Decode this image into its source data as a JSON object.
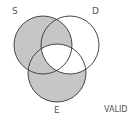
{
  "diagram": {
    "type": "venn",
    "sets": [
      "S",
      "D",
      "E"
    ],
    "shaded_regions": [
      "S only",
      "S∩D only",
      "S∩E only",
      "E only"
    ],
    "unshaded_regions": [
      "D only",
      "D∩E only",
      "S∩D∩E"
    ],
    "verdict": "VALID",
    "shade_color": "#c6c6c6",
    "stroke_color": "#333333"
  },
  "labels": {
    "s": "S",
    "d": "D",
    "e": "E",
    "verdict": "VALID"
  }
}
